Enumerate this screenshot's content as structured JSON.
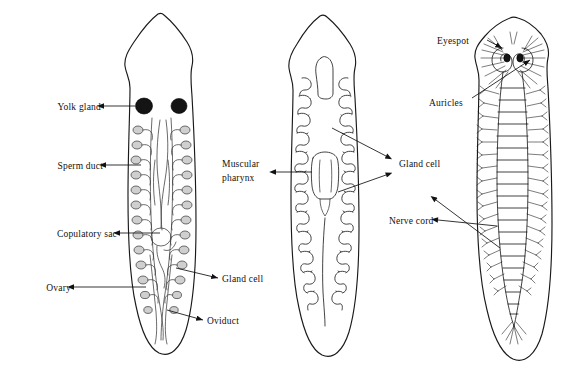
{
  "figure": {
    "background_color": "#ffffff",
    "ink_color": "#111111",
    "width": 583,
    "height": 374
  },
  "panels": [
    {
      "id": "panel-reproductive",
      "name": "left-worm-reproductive-system",
      "description": "Planarian reproductive system with yolk glands, sperm ducts, ovaries, copulatory sac and oviduct"
    },
    {
      "id": "panel-digestive",
      "name": "middle-worm-digestive-system",
      "description": "Planarian digestive system showing three-branched gut and muscular pharynx"
    },
    {
      "id": "panel-nervous",
      "name": "right-worm-nervous-system",
      "description": "Planarian nervous system with eyespots, auricles, cerebral ganglia and ladder-like nerve cords"
    }
  ],
  "labels": [
    {
      "id": "yolk-gland",
      "text": "Yolk gland",
      "x": 60,
      "y": 108,
      "anchor": "end",
      "arrow": "left",
      "lines": [
        "Yolk gland"
      ]
    },
    {
      "id": "sperm-duct",
      "text": "Sperm duct",
      "x": 60,
      "y": 168,
      "anchor": "end",
      "arrow": "left",
      "lines": [
        "Sperm duct"
      ]
    },
    {
      "id": "copulatory-sac",
      "text": "Copulatory sac",
      "x": 60,
      "y": 236,
      "anchor": "end",
      "arrow": "left",
      "lines": [
        "Copulatory sac"
      ]
    },
    {
      "id": "ovary",
      "text": "Ovary",
      "x": 60,
      "y": 290,
      "anchor": "end",
      "arrow": "left",
      "lines": [
        "Ovary"
      ]
    },
    {
      "id": "gland-cell-left",
      "text": "Gland cell",
      "x": 222,
      "y": 282,
      "anchor": "start",
      "arrow": "right",
      "lines": [
        "Gland cell"
      ]
    },
    {
      "id": "oviduct",
      "text": "Oviduct",
      "x": 207,
      "y": 324,
      "anchor": "start",
      "arrow": "right",
      "lines": [
        "Oviduct"
      ]
    },
    {
      "id": "muscular-pharynx",
      "text": "Muscular pharynx",
      "x": 222,
      "y": 166,
      "anchor": "start",
      "arrow": "right",
      "lines": [
        "Muscular",
        "pharynx"
      ]
    },
    {
      "id": "gland-cell-middle",
      "text": "Gland cell",
      "x": 399,
      "y": 163,
      "anchor": "start",
      "arrow": "left",
      "lines": [
        "Gland cell"
      ]
    },
    {
      "id": "eyespot",
      "text": "Eyespot",
      "x": 437,
      "y": 42,
      "anchor": "start",
      "arrow": "right",
      "lines": [
        "Eyespot"
      ]
    },
    {
      "id": "auricles",
      "text": "Auricles",
      "x": 429,
      "y": 106,
      "anchor": "start",
      "arrow": "upright",
      "lines": [
        "Auricles"
      ]
    },
    {
      "id": "nerve-cord",
      "text": "Nerve cord",
      "x": 389,
      "y": 222,
      "anchor": "start",
      "arrow": "right",
      "lines": [
        "Nerve cord"
      ]
    }
  ],
  "label_text": {
    "yolk_gland": "Yolk gland",
    "sperm_duct": "Sperm duct",
    "copulatory_sac": "Copulatory sac",
    "ovary": "Ovary",
    "gland_cell_left": "Gland cell",
    "oviduct": "Oviduct",
    "muscular_line1": "Muscular",
    "muscular_line2": "pharynx",
    "gland_cell_middle": "Gland cell",
    "eyespot": "Eyespot",
    "auricles": "Auricles",
    "nerve_cord": "Nerve cord"
  }
}
